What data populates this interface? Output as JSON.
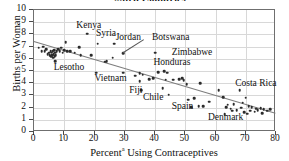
{
  "chart_data": {
    "type": "scatter",
    "title": "...ited Countries",
    "xlabel": "Percentᵃ Using Contraceptives",
    "xlabel_text": "Percent",
    "xlabel_sup": "a",
    "xlabel_rest": " Using Contraceptives",
    "ylabel": "Births per Woman",
    "xlim": [
      0,
      80
    ],
    "ylim": [
      0,
      10
    ],
    "xticks": [
      0,
      10,
      20,
      30,
      40,
      50,
      60,
      70,
      80
    ],
    "yticks": [
      0,
      1,
      2,
      3,
      4,
      5,
      6,
      7,
      8,
      9,
      10
    ],
    "grid": true,
    "legend": "none",
    "point_color": "#2b2b2b",
    "fit_color": "#7d7d7d",
    "fit_line": {
      "x0": 0,
      "y0": 7.45,
      "x1": 80,
      "y1": 1.55
    },
    "points": [
      [
        1.5,
        6.9
      ],
      [
        2.5,
        6.6
      ],
      [
        3.0,
        7.0
      ],
      [
        3.5,
        6.6
      ],
      [
        4.0,
        6.8
      ],
      [
        4.5,
        6.4
      ],
      [
        5.0,
        6.5
      ],
      [
        5.2,
        6.3
      ],
      [
        5.5,
        6.6
      ],
      [
        5.6,
        6.2
      ],
      [
        5.8,
        6.5
      ],
      [
        6.0,
        6.3
      ],
      [
        6.2,
        6.6
      ],
      [
        6.3,
        6.1
      ],
      [
        6.5,
        6.4
      ],
      [
        6.6,
        6.7
      ],
      [
        6.8,
        6.2
      ],
      [
        7.0,
        6.5
      ],
      [
        7.0,
        5.8
      ],
      [
        7.2,
        6.3
      ],
      [
        7.5,
        6.6
      ],
      [
        8.0,
        6.8
      ],
      [
        8.5,
        6.6
      ],
      [
        9.0,
        6.9
      ],
      [
        9.5,
        6.5
      ],
      [
        10.0,
        6.7
      ],
      [
        10.5,
        7.35
      ],
      [
        11.0,
        6.6
      ],
      [
        12.0,
        6.6
      ],
      [
        13.5,
        6.5
      ],
      [
        15.0,
        6.95
      ],
      [
        15.5,
        6.3
      ],
      [
        17.5,
        8.05
      ],
      [
        19.0,
        6.3
      ],
      [
        20.5,
        4.85
      ],
      [
        21.0,
        7.25
      ],
      [
        23.5,
        5.75
      ],
      [
        24.0,
        5.8
      ],
      [
        26.0,
        6.1
      ],
      [
        26.5,
        7.25
      ],
      [
        29.5,
        6.45
      ],
      [
        29.5,
        4.85
      ],
      [
        33.5,
        4.6
      ],
      [
        35.0,
        4.8
      ],
      [
        35.0,
        4.15
      ],
      [
        35.5,
        3.45
      ],
      [
        36.0,
        4.7
      ],
      [
        38.0,
        4.35
      ],
      [
        39.5,
        4.4
      ],
      [
        40.0,
        6.5
      ],
      [
        41.0,
        4.9
      ],
      [
        42.5,
        3.6
      ],
      [
        43.0,
        5.0
      ],
      [
        43.5,
        4.3
      ],
      [
        44.0,
        4.85
      ],
      [
        44.5,
        3.05
      ],
      [
        46.0,
        4.3
      ],
      [
        48.0,
        4.35
      ],
      [
        49.0,
        4.4
      ],
      [
        49.5,
        4.25
      ],
      [
        50.5,
        3.9
      ],
      [
        51.0,
        2.65
      ],
      [
        52.0,
        2.05
      ],
      [
        53.0,
        2.75
      ],
      [
        54.5,
        2.1
      ],
      [
        55.0,
        4.0
      ],
      [
        56.0,
        2.1
      ],
      [
        58.0,
        2.5
      ],
      [
        61.0,
        3.45
      ],
      [
        62.5,
        2.85
      ],
      [
        63.0,
        1.45
      ],
      [
        63.5,
        2.05
      ],
      [
        64.0,
        2.25
      ],
      [
        65.0,
        1.9
      ],
      [
        65.5,
        1.75
      ],
      [
        66.0,
        2.3
      ],
      [
        67.0,
        1.8
      ],
      [
        68.0,
        3.45
      ],
      [
        68.5,
        2.0
      ],
      [
        69.0,
        2.4
      ],
      [
        69.5,
        1.6
      ],
      [
        70.0,
        2.8
      ],
      [
        70.5,
        1.5
      ],
      [
        71.0,
        2.1
      ],
      [
        71.5,
        1.75
      ],
      [
        72.0,
        2.05
      ],
      [
        73.0,
        1.65
      ],
      [
        73.5,
        1.9
      ],
      [
        74.0,
        1.8
      ],
      [
        75.0,
        1.95
      ],
      [
        75.5,
        1.55
      ],
      [
        76.0,
        1.85
      ],
      [
        77.0,
        1.75
      ],
      [
        78.0,
        1.85
      ]
    ],
    "annotations": [
      {
        "label": "Kenya",
        "lx": 14.0,
        "ly": 8.75
      },
      {
        "label": "Syria",
        "lx": 20.5,
        "ly": 8.15
      },
      {
        "label": "Jordan",
        "lx": 27.0,
        "ly": 7.75
      },
      {
        "label": "Botswana",
        "lx": 39.0,
        "ly": 7.75
      },
      {
        "label": "Zimbabwe",
        "lx": 45.5,
        "ly": 6.55
      },
      {
        "label": "Honduras",
        "lx": 39.5,
        "ly": 5.75
      },
      {
        "label": "Lesotho",
        "lx": 6.5,
        "ly": 5.35
      },
      {
        "label": "Vietnam",
        "lx": 20.0,
        "ly": 4.45
      },
      {
        "label": "Fiji",
        "lx": 31.5,
        "ly": 3.45
      },
      {
        "label": "Chile",
        "lx": 36.0,
        "ly": 2.85
      },
      {
        "label": "Spain",
        "lx": 45.5,
        "ly": 2.15
      },
      {
        "label": "Denmark",
        "lx": 57.5,
        "ly": 1.25
      },
      {
        "label": "Costa Rica",
        "lx": 66.5,
        "ly": 4.0
      }
    ],
    "leaders": [
      {
        "x0": 36.5,
        "y0": 7.55,
        "x1": 29.5,
        "y1": 6.45
      }
    ]
  }
}
